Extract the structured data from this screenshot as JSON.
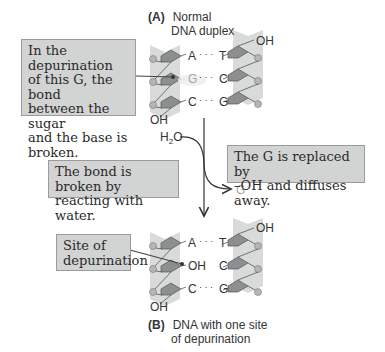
{
  "panel_a": {
    "letter": "(A)",
    "title_line1": "Normal",
    "title_line2": "DNA duplex",
    "pairs": [
      {
        "left": "A",
        "bond": "· · ·",
        "right": "T"
      },
      {
        "left": "G",
        "bond": "· · ·",
        "right": "C"
      },
      {
        "left": "C",
        "bond": "· · ·",
        "right": "G"
      }
    ],
    "terminal_top": "OH",
    "terminal_bottom": "OH"
  },
  "panel_b": {
    "letter": "(B)",
    "title_line1": "DNA with one site",
    "title_line2": "of depurination",
    "pairs": [
      {
        "left": "A",
        "bond": "· · ·",
        "right": "T"
      },
      {
        "left": "OH",
        "bond": "",
        "right": "C"
      },
      {
        "left": "C",
        "bond": "· · ·",
        "right": "G"
      }
    ],
    "terminal_top": "OH",
    "terminal_bottom": "OH"
  },
  "callouts": {
    "depurination_bond": [
      "In the depurination",
      "of this G, the bond",
      "between the sugar",
      "and the base is",
      "broken."
    ],
    "water": [
      "The bond is broken by",
      "reacting with water."
    ],
    "replaced": [
      "The G is replaced by",
      "–OH and diffuses away."
    ],
    "site": [
      "Site of",
      "depurination"
    ]
  },
  "reaction": {
    "reactant": "H2O",
    "reactant_main": "H",
    "reactant_sub": "2",
    "reactant_tail": "O",
    "product": "G"
  },
  "colors": {
    "strand_bg": "#d9dada",
    "sugar_fill": "#8d8e8f",
    "phosphate": "#b5b6b7",
    "callout_bg": "#d2d3d3",
    "leader": "#444444"
  }
}
